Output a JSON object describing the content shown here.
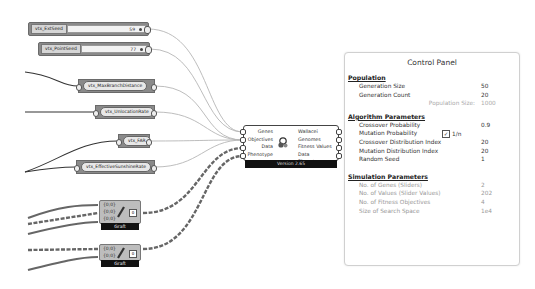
{
  "canvas": {
    "sliders": [
      {
        "name": "vtx_ExtSeed",
        "value": "59"
      },
      {
        "name": "vtx_PointSeed",
        "value": "77"
      }
    ],
    "params": [
      {
        "name": "vtx_MaxBranchDistance"
      },
      {
        "name": "vtx_UnlocationRate"
      },
      {
        "name": "vtx_FAR"
      },
      {
        "name": "vtx_EffectiveSunshineRate"
      }
    ],
    "component": {
      "inputs": [
        "Genes",
        "Objectives",
        "Data",
        "Phenotype"
      ],
      "outputs": [
        "Wallacei Genomes",
        "Fitness Values",
        "Data",
        "Phenotypes"
      ],
      "footer": "Version 2.65",
      "icon": "wallacei-icon"
    },
    "grafts": [
      {
        "inputs": [
          "{0;0}",
          "{0;0}",
          "{0;0}"
        ],
        "output_marker": "0",
        "label": "Graft"
      },
      {
        "inputs": [
          "{0;0}",
          "{0;0}"
        ],
        "output_marker": "0",
        "label": "Graft"
      }
    ]
  },
  "control_panel": {
    "title": "Control Panel",
    "population": {
      "heading": "Population",
      "rows": [
        {
          "label": "Generation Size",
          "value": "50"
        },
        {
          "label": "Generation Count",
          "value": "20"
        }
      ],
      "note": {
        "label": "Population Size:",
        "value": "1000"
      }
    },
    "algorithm": {
      "heading": "Algorithm Parameters",
      "rows": [
        {
          "label": "Crossover Probability",
          "value": "0.9"
        },
        {
          "label": "Mutation Probability",
          "value": "",
          "checkbox_label": "1/n",
          "checked": true
        },
        {
          "label": "Crossover Distribution Index",
          "value": "20"
        },
        {
          "label": "Mutation Distribution Index",
          "value": "20"
        },
        {
          "label": "Random Seed",
          "value": "1"
        }
      ]
    },
    "simulation": {
      "heading": "Simulation Parameters",
      "rows": [
        {
          "label": "No. of Genes (Sliders)",
          "value": "2"
        },
        {
          "label": "No. of Values (Slider Values)",
          "value": "202"
        },
        {
          "label": "No. of Fitness Objectives",
          "value": "4"
        },
        {
          "label": "Size of Search Space",
          "value": "1e4"
        }
      ]
    }
  }
}
